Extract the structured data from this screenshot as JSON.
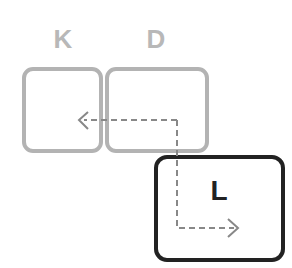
{
  "labels": {
    "k": "K",
    "d": "D",
    "l": "L"
  },
  "colors": {
    "inactive": "#b3b3b3",
    "active": "#222222",
    "dash": "#888888"
  }
}
